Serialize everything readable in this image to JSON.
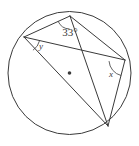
{
  "figure": {
    "name": "circle-with-inscribed-chords",
    "type": "geometry-diagram",
    "background_color": "#ffffff",
    "stroke_color": "#3a3a3a",
    "circle": {
      "center_x": 69.5,
      "center_y": 73,
      "radius": 61.5,
      "center_dot_visible": true,
      "center_dot_radius": 1.8
    },
    "points": [
      {
        "id": "T",
        "name": "top-vertex",
        "x": 70,
        "y": 16
      },
      {
        "id": "L",
        "name": "left-vertex",
        "x": 24,
        "y": 37
      },
      {
        "id": "R",
        "name": "right-vertex",
        "x": 125,
        "y": 60
      },
      {
        "id": "B",
        "name": "bottom-right-vertex",
        "x": 108,
        "y": 126
      },
      {
        "id": "O",
        "name": "center-point",
        "x": 69.5,
        "y": 73
      }
    ],
    "chords": [
      {
        "id": "LT",
        "name": "chord-left-top",
        "from": "L",
        "to": "T"
      },
      {
        "id": "LR",
        "name": "chord-left-right",
        "from": "L",
        "to": "R"
      },
      {
        "id": "LB",
        "name": "diameter-left-bottom",
        "from": "L",
        "to": "B",
        "is_diameter": true
      },
      {
        "id": "TR",
        "name": "chord-top-right",
        "from": "T",
        "to": "R"
      },
      {
        "id": "TB",
        "name": "chord-top-bottom",
        "from": "T",
        "to": "B"
      },
      {
        "id": "RB",
        "name": "chord-right-bottom",
        "from": "R",
        "to": "B"
      }
    ],
    "angles": [
      {
        "id": "angle-33",
        "name": "angle-33-degrees",
        "label": "33°",
        "vertex": "T",
        "label_x": 70,
        "label_y": 36,
        "font_size": 11,
        "arc": {
          "cx": 70,
          "cy": 16,
          "r": 13,
          "start_deg": 92,
          "end_deg": 156
        }
      },
      {
        "id": "angle-y",
        "name": "angle-y",
        "label": "y",
        "vertex": "L",
        "label_x": 41,
        "label_y": 49,
        "font_size": 9,
        "arc": {
          "cx": 24,
          "cy": 37,
          "r": 16,
          "start_deg": 13,
          "end_deg": 56
        }
      },
      {
        "id": "angle-x",
        "name": "angle-x",
        "label": "x",
        "vertex": "R",
        "label_x": 111,
        "label_y": 77,
        "font_size": 9,
        "arc": {
          "cx": 125,
          "cy": 60,
          "r": 16,
          "start_deg": 104,
          "end_deg": 176
        }
      }
    ]
  }
}
